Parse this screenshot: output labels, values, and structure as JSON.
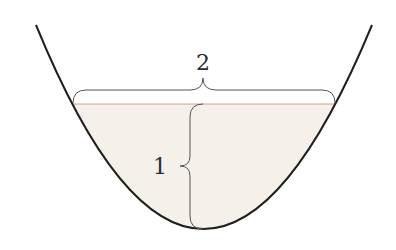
{
  "diagram": {
    "type": "parabolic-basin-with-fill",
    "labels": {
      "width": "2",
      "depth": "1"
    },
    "colors": {
      "background": "#ffffff",
      "curve": "#1f1f1f",
      "fill": "#f5f0ea",
      "waterline": "#c8a292",
      "brace": "#555555",
      "label": "#2b2b2b"
    }
  }
}
